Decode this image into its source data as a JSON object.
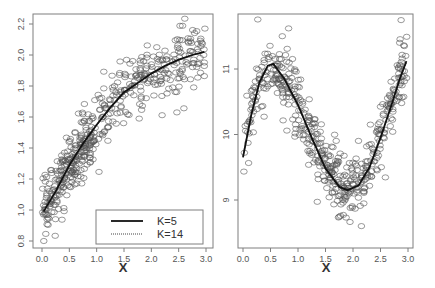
{
  "chart_data": [
    {
      "type": "scatter",
      "title": "",
      "xlabel": "X",
      "ylabel": "",
      "xlim": [
        0.0,
        3.0
      ],
      "ylim": [
        0.75,
        2.28
      ],
      "grid": false,
      "x_ticks": [
        "0.0",
        "0.5",
        "1.0",
        "1.5",
        "2.0",
        "2.5",
        "3.0"
      ],
      "y_ticks": [
        "0.8",
        "1.0",
        "1.2",
        "1.4",
        "1.6",
        "1.8",
        "2.0",
        "2.2"
      ],
      "legend": {
        "position": "bottom-right",
        "entries": [
          {
            "label": "K=5",
            "style": "solid"
          },
          {
            "label": "K=14",
            "style": "dotted"
          }
        ]
      },
      "series": [
        {
          "name": "observations",
          "kind": "points",
          "n_approx": 500,
          "noise_sd": 0.1
        },
        {
          "name": "K=5",
          "kind": "line",
          "x": [
            0.03,
            0.25,
            0.5,
            0.75,
            1.0,
            1.25,
            1.5,
            1.75,
            2.0,
            2.25,
            2.5,
            2.75,
            2.97
          ],
          "y": [
            0.99,
            1.12,
            1.29,
            1.43,
            1.55,
            1.66,
            1.76,
            1.82,
            1.88,
            1.93,
            1.97,
            2.0,
            2.02
          ]
        },
        {
          "name": "K=14",
          "kind": "line",
          "x": [
            0.03,
            0.25,
            0.5,
            0.75,
            1.0,
            1.25,
            1.5,
            1.75,
            2.0,
            2.25,
            2.5,
            2.75,
            2.97
          ],
          "y": [
            1.0,
            1.12,
            1.28,
            1.42,
            1.55,
            1.66,
            1.75,
            1.82,
            1.88,
            1.93,
            1.97,
            2.0,
            2.02
          ]
        }
      ]
    },
    {
      "type": "scatter",
      "title": "",
      "xlabel": "X",
      "ylabel": "",
      "xlim": [
        0.0,
        3.0
      ],
      "ylim": [
        8.15,
        11.85
      ],
      "grid": false,
      "x_ticks": [
        "0.0",
        "0.5",
        "1.0",
        "1.5",
        "2.0",
        "2.5",
        "3.0"
      ],
      "y_ticks": [
        "9",
        "10",
        "11"
      ],
      "series": [
        {
          "name": "observations",
          "kind": "points",
          "n_approx": 500,
          "noise_sd": 0.25
        },
        {
          "name": "K=5",
          "kind": "line",
          "x": [
            0.0,
            0.15,
            0.3,
            0.45,
            0.55,
            0.75,
            1.0,
            1.25,
            1.5,
            1.75,
            1.9,
            2.1,
            2.3,
            2.5,
            2.7,
            2.85,
            2.97
          ],
          "y": [
            9.65,
            10.3,
            10.8,
            11.05,
            11.08,
            10.85,
            10.45,
            9.95,
            9.48,
            9.2,
            9.15,
            9.22,
            9.5,
            9.95,
            10.45,
            10.85,
            11.12
          ]
        },
        {
          "name": "K=14",
          "kind": "line",
          "x": [
            0.0,
            0.15,
            0.3,
            0.45,
            0.55,
            0.75,
            1.0,
            1.25,
            1.5,
            1.75,
            1.9,
            2.1,
            2.3,
            2.5,
            2.7,
            2.85,
            2.97
          ],
          "y": [
            9.68,
            10.3,
            10.78,
            11.03,
            11.06,
            10.85,
            10.45,
            9.95,
            9.5,
            9.22,
            9.16,
            9.22,
            9.5,
            9.95,
            10.45,
            10.85,
            11.1
          ]
        }
      ]
    }
  ],
  "panels": [
    {
      "frame": {
        "x0": 33,
        "y0": 14,
        "x1": 213,
        "y1": 248
      },
      "x_map": {
        "v0": 0.0,
        "p0": 42,
        "v1": 3.0,
        "p1": 206
      },
      "y_map": {
        "v0": 0.8,
        "p0": 241,
        "v1": 2.2,
        "p1": 24
      },
      "y_tick_values": [
        0.8,
        1.0,
        1.2,
        1.4,
        1.6,
        1.8,
        2.0,
        2.2
      ],
      "x_tick_values": [
        0.0,
        0.5,
        1.0,
        1.5,
        2.0,
        2.5,
        3.0
      ],
      "xlabel_pos": {
        "x": 123,
        "y": 272
      },
      "seed": 7,
      "func": "sqrtlike",
      "legend_box": {
        "x": 96,
        "y": 210,
        "w": 107,
        "h": 34
      }
    },
    {
      "frame": {
        "x0": 238,
        "y0": 14,
        "x1": 413,
        "y1": 248
      },
      "x_map": {
        "v0": 0.0,
        "p0": 243,
        "v1": 3.0,
        "p1": 408
      },
      "y_map": {
        "v0": 9.0,
        "p0": 200,
        "v1": 11.0,
        "p1": 69
      },
      "y_tick_values": [
        9,
        10,
        11
      ],
      "x_tick_values": [
        0.0,
        0.5,
        1.0,
        1.5,
        2.0,
        2.5,
        3.0
      ],
      "xlabel_pos": {
        "x": 326,
        "y": 272
      },
      "seed": 13,
      "func": "sine"
    }
  ],
  "legend": {
    "entries": [
      {
        "label": "K=5"
      },
      {
        "label": "K=14"
      }
    ]
  },
  "labels": {
    "left_xlabel": "X",
    "right_xlabel": "X",
    "left_y_ticks": [
      "0.8",
      "1.0",
      "1.2",
      "1.4",
      "1.6",
      "1.8",
      "2.0",
      "2.2"
    ],
    "right_y_ticks": [
      "9",
      "10",
      "11"
    ],
    "x_ticks": [
      "0.0",
      "0.5",
      "1.0",
      "1.5",
      "2.0",
      "2.5",
      "3.0"
    ]
  }
}
